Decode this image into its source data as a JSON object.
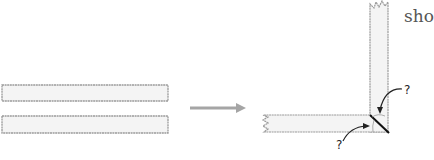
{
  "diagram": {
    "type": "woodworking-miter-joint",
    "text_fragment": "sho",
    "question_marks": [
      "?",
      "?"
    ],
    "colors": {
      "board_fill": "#f4f4f4",
      "board_edge": "#9a9a9a",
      "arrow": "#9a9a9a",
      "miter_line": "#111111",
      "curved_arrows": "#222222"
    },
    "parts": {
      "before": "two straight boards stacked",
      "transition": "arrow pointing right",
      "after": "boards joined at right-angle corner with miter cut; angles marked with question marks"
    }
  }
}
